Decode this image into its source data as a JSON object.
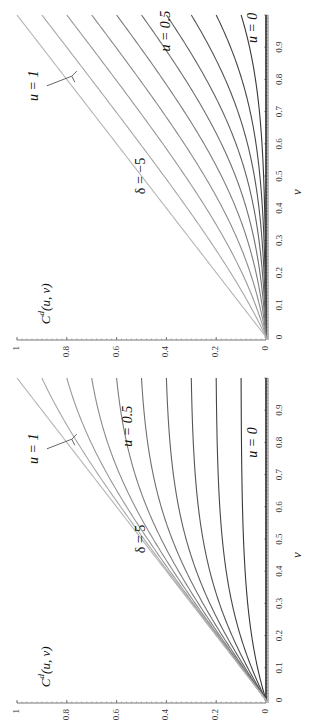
{
  "figure": {
    "rotation_deg": -90,
    "panels": [
      {
        "id": "panel-delta-neg5",
        "delta_label": "δ = −5",
        "y_label": "Cd(u, v)",
        "x_label": "v",
        "u_label_high": "u = 1",
        "u_label_mid": "u = 0.5",
        "u_label_low": "u = 0"
      },
      {
        "id": "panel-delta-5",
        "delta_label": "δ = 5",
        "y_label": "Cd(u, v)",
        "x_label": "v",
        "u_label_high": "u = 1",
        "u_label_mid": "u = 0.5",
        "u_label_low": "u = 0"
      }
    ]
  },
  "chart_data": [
    {
      "type": "line",
      "title": "δ = −5",
      "xlabel": "v",
      "ylabel": "C^d(u, v)",
      "xlim": [
        0,
        1
      ],
      "ylim": [
        0,
        1
      ],
      "x_ticks": [
        "0",
        "0.1",
        "0.2",
        "0.3",
        "0.4",
        "0.5",
        "0.6",
        "0.7",
        "0.8",
        "0.9"
      ],
      "y_ticks": [
        "0",
        "0.2",
        "0.4",
        "0.6",
        "0.8",
        "1"
      ],
      "delta": -5,
      "series_param": "u",
      "u_values": [
        0,
        0.1,
        0.2,
        0.3,
        0.4,
        0.5,
        0.6,
        0.7,
        0.8,
        0.9,
        1
      ],
      "annotations": [
        "u = 1",
        "u = 0.5",
        "u = 0",
        "δ = −5"
      ],
      "grid": false,
      "legend": "none"
    },
    {
      "type": "line",
      "title": "δ = 5",
      "xlabel": "v",
      "ylabel": "C^d(u, v)",
      "xlim": [
        0,
        1
      ],
      "ylim": [
        0,
        1
      ],
      "x_ticks": [
        "0",
        "0.1",
        "0.2",
        "0.3",
        "0.4",
        "0.5",
        "0.6",
        "0.7",
        "0.8",
        "0.9"
      ],
      "y_ticks": [
        "0",
        "0.2",
        "0.4",
        "0.6",
        "0.8",
        "1"
      ],
      "delta": 5,
      "series_param": "u",
      "u_values": [
        0,
        0.1,
        0.2,
        0.3,
        0.4,
        0.5,
        0.6,
        0.7,
        0.8,
        0.9,
        1
      ],
      "annotations": [
        "u = 1",
        "u = 0.5",
        "u = 0",
        "δ = 5"
      ],
      "grid": false,
      "legend": "none"
    }
  ],
  "colors": {
    "axis": "#777777",
    "curve_dark": "#2a2a2a",
    "curve_light": "#b5b5b5"
  }
}
